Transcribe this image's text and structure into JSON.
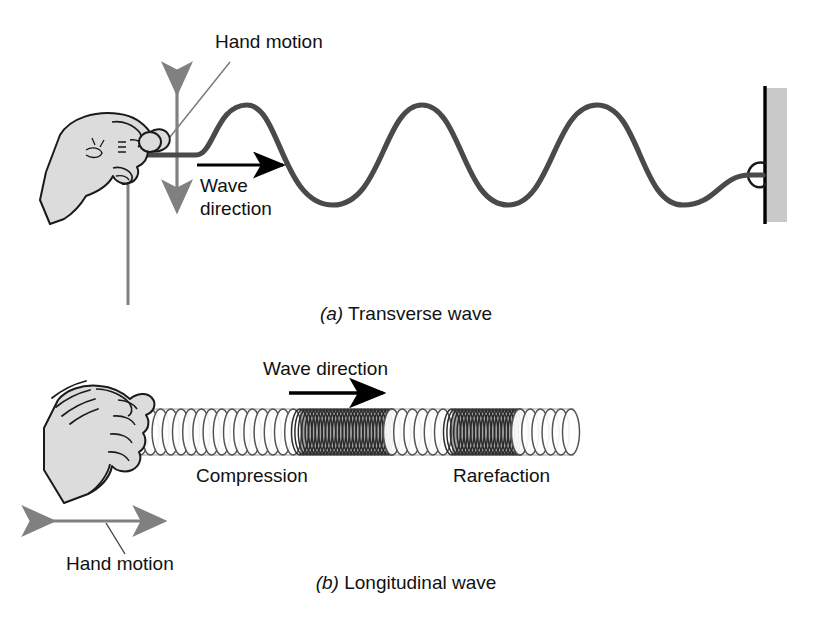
{
  "figure": {
    "background_color": "#ffffff"
  },
  "colors": {
    "rope": "#4a4a4a",
    "arrow_gray": "#808080",
    "arrow_black": "#000000",
    "wall_fill": "#c9c9c9",
    "wall_edge": "#000000",
    "hand_fill": "#dcdcdc",
    "hand_outline": "#1a1a1a",
    "coil_outline": "#555555",
    "compression_fill": "#555555",
    "text": "#111111",
    "leader_line": "#777777"
  },
  "panel_a": {
    "caption_marker": "(a)",
    "caption_text": " Transverse wave",
    "hand_motion_label": "Hand motion",
    "wave_direction_label_line1": "Wave",
    "wave_direction_label_line2": "direction",
    "hand_motion_arrow": "vertical-double-arrow",
    "wave_direction_arrow": "right-arrow",
    "wall": "fixed-wall",
    "rope": "transverse-wave-rope",
    "wave_cycles": 3,
    "oscillation_axis": "vertical"
  },
  "panel_b": {
    "caption_marker": "(b)",
    "caption_text": " Longitudinal wave",
    "wave_direction_label": "Wave direction",
    "compression_label": "Compression",
    "rarefaction_label": "Rarefaction",
    "hand_motion_label": "Hand motion",
    "hand_motion_arrow": "horizontal-double-arrow",
    "wave_direction_arrow": "right-arrow",
    "spring": "slinky-coil-spring",
    "oscillation_axis": "horizontal",
    "compression_zones": 2
  },
  "chart_data": {
    "type": "line",
    "xlabel": "",
    "ylabel": "",
    "x": [
      160,
      200,
      245,
      290,
      330,
      375,
      420,
      465,
      505,
      550,
      595,
      640,
      680,
      725,
      763
    ],
    "values": [
      155,
      150,
      105,
      155,
      205,
      155,
      105,
      155,
      205,
      155,
      105,
      155,
      205,
      175,
      175
    ],
    "ylim": [
      105,
      205
    ],
    "grid": false,
    "legend": null,
    "annotations": [
      "Hand motion",
      "Wave direction"
    ]
  }
}
